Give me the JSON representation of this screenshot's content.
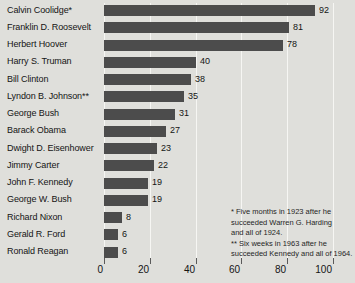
{
  "chart_data": {
    "type": "bar",
    "orientation": "horizontal",
    "title": "",
    "xlabel": "",
    "ylabel": "",
    "categories": [
      "Calvin Coolidge*",
      "Franklin D. Roosevelt",
      "Herbert Hoover",
      "Harry S. Truman",
      "Bill Clinton",
      "Lyndon B. Johnson**",
      "George Bush",
      "Barack Obama",
      "Dwight D. Eisenhower",
      "Jimmy Carter",
      "John F. Kennedy",
      "George W. Bush",
      "Richard Nixon",
      "Gerald R. Ford",
      "Ronald Reagan"
    ],
    "values": [
      92,
      81,
      78,
      40,
      38,
      35,
      31,
      27,
      23,
      22,
      19,
      19,
      8,
      6,
      6
    ],
    "xlim": [
      0,
      100
    ],
    "x_ticks": [
      0,
      20,
      40,
      60,
      80,
      100
    ],
    "grid": "vertical",
    "legend": "none",
    "bar_color": "#4c4c4c",
    "background_color": "#dfdfdb",
    "gridline_color": "#f6f6f3",
    "footnotes": [
      "* Five months in 1923 after he succeeded Warren G. Harding and all of 1924.",
      "** Six weeks in 1963 after he succeeded Kennedy and all of 1964."
    ],
    "footnote_lines": [
      "* Five months in 1923 after he",
      "succeeded Warren G. Harding",
      "and all of 1924.",
      "** Six weeks in 1963 after he",
      "succeeded Kennedy and all of 1964."
    ]
  }
}
